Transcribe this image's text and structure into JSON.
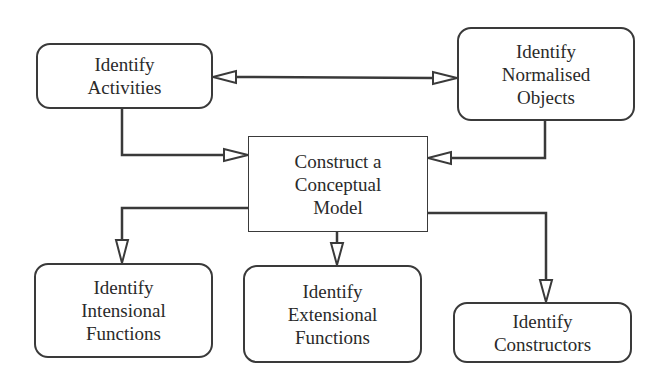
{
  "diagram": {
    "nodes": {
      "activities": {
        "label": "Identify\nActivities"
      },
      "objects": {
        "label": "Identify\nNormalised\nObjects"
      },
      "model": {
        "label": "Construct a\nConceptual\nModel"
      },
      "intensional": {
        "label": "Identify\nIntensional\nFunctions"
      },
      "extensional": {
        "label": "Identify\nExtensional\nFunctions"
      },
      "constructors": {
        "label": "Identify\nConstructors"
      }
    },
    "edges": [
      {
        "from": "activities",
        "to": "objects",
        "type": "bidirectional"
      },
      {
        "from": "activities",
        "to": "model",
        "type": "directed"
      },
      {
        "from": "objects",
        "to": "model",
        "type": "directed"
      },
      {
        "from": "model",
        "to": "intensional",
        "type": "directed"
      },
      {
        "from": "model",
        "to": "extensional",
        "type": "directed"
      },
      {
        "from": "model",
        "to": "constructors",
        "type": "directed"
      }
    ],
    "colors": {
      "stroke": "#3a3a3a",
      "background": "#ffffff",
      "text": "#2a2a2a"
    }
  }
}
